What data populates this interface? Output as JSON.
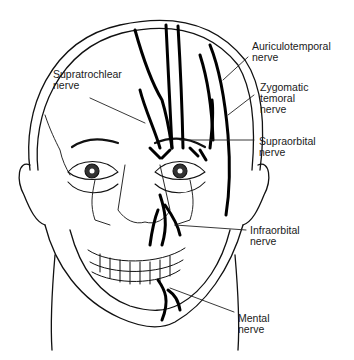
{
  "figure": {
    "colors": {
      "line": "#111111",
      "background": "#ffffff",
      "label": "#1a1a1a"
    }
  },
  "labels": {
    "auriculotemporal": {
      "line1": "Auriculotemporal",
      "line2": "nerve"
    },
    "zygomatic": {
      "line1": "Zygomatic",
      "line2": "temoral",
      "line3": "nerve"
    },
    "supraorbital": {
      "line1": "Supraorbital",
      "line2": "nerve"
    },
    "supratrochlear": {
      "line1": "Supratrochlear",
      "line2": "nerve"
    },
    "infraorbital": {
      "line1": "Infraorbital",
      "line2": "nerve"
    },
    "mental": {
      "line1": "Mental",
      "line2": "nerve"
    }
  }
}
